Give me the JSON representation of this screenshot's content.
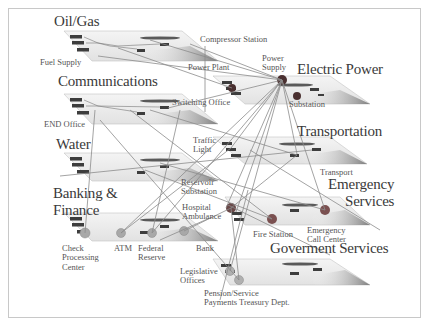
{
  "diagram": {
    "type": "interdependent infrastructure layers",
    "sectors": [
      {
        "id": "oil_gas",
        "title": "Oil/Gas",
        "labels": [
          "Compressor Station",
          "Fuel Supply"
        ]
      },
      {
        "id": "electric",
        "title": "Electric Power",
        "labels": [
          "Power Plant",
          "Power\nSupply",
          "Substation"
        ]
      },
      {
        "id": "communications",
        "title": "Communications",
        "labels": [
          "Switching Office",
          "END Office"
        ]
      },
      {
        "id": "transportation",
        "title": "Transportation",
        "labels": [
          "Traffic\nLight",
          "Transport"
        ]
      },
      {
        "id": "water",
        "title": "Water",
        "labels": [
          "Reservoir\nSubstation"
        ]
      },
      {
        "id": "emergency",
        "title": "Emergency\nServices",
        "labels": [
          "Hospital\nAmbulance",
          "Fire Station",
          "Emergency\nCall Center"
        ]
      },
      {
        "id": "banking",
        "title": "Banking &\nFinance",
        "labels": [
          "Check\nProcessing\nCenter",
          "ATM",
          "Federal\nReserve",
          "Bank"
        ]
      },
      {
        "id": "government",
        "title": "Goverment   Services",
        "labels": [
          "Legislative\nOffices",
          "Pension/Service\nPayments Treasury Dept."
        ]
      }
    ]
  },
  "labels": {
    "oil_gas": "Oil/Gas",
    "compressor_station": "Compressor Station",
    "fuel_supply": "Fuel Supply",
    "power_plant": "Power Plant",
    "power_supply": "Power\nSupply",
    "electric_power": "Electric Power",
    "communications": "Communications",
    "switching_office": "Switching Office",
    "substation": "Substation",
    "end_office": "END Office",
    "transportation": "Transportation",
    "water": "Water",
    "traffic_light": "Traffic\nLight",
    "transport": "Transport",
    "reservoir_substation": "Reservoir\nSubstation",
    "emergency_services": "Emergency\nServices",
    "banking_finance": "Banking &\nFinance",
    "hospital_ambulance": "Hospital\nAmbulance",
    "check_processing": "Check\nProcessing\nCenter",
    "atm": "ATM",
    "federal_reserve": "Federal\nReserve",
    "bank": "Bank",
    "fire_station": "Fire Station",
    "emergency_call_center": "Emergency\nCall Center",
    "government_services": "Goverment   Services",
    "legislative_offices": "Legislative\nOffices",
    "pension_payments": "Pension/Service\nPayments Treasury Dept."
  },
  "colors": {
    "plane_fill": "#ececec",
    "plane_edge": "#bdbdbd",
    "shade": "#8a8a8a",
    "box": "#3d3d3d",
    "node_electric": "#4a3030",
    "node_emergency": "#7a5050",
    "node_gray": "#a8a8a8",
    "link": "#8c8c8c",
    "text": "#444444"
  }
}
